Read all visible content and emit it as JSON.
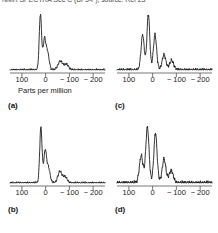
{
  "figure": {
    "clipped_header_text": "NMR SPECTRA See  C (BF3-F); source: Ref 23",
    "axis_caption": "Parts per million",
    "axis_caption_panel": "a"
  },
  "axis": {
    "tick_labels": [
      "100",
      "0",
      "− 100",
      "− 200"
    ],
    "tick_values": [
      100,
      0,
      -100,
      -200
    ],
    "xlim": [
      150,
      -250
    ],
    "xlabel": "Parts per million"
  },
  "panels": [
    {
      "key": "a",
      "label": "(a)"
    },
    {
      "key": "b",
      "label": "(b)"
    },
    {
      "key": "c",
      "label": "(c)"
    },
    {
      "key": "d",
      "label": "(d)"
    }
  ],
  "chart_data": [
    {
      "type": "line",
      "id": "a",
      "title": "(a)",
      "xlabel": "Parts per million",
      "ylabel": "",
      "xlim": [
        150,
        -250
      ],
      "ylim": [
        0,
        1
      ],
      "grid": false,
      "legend": "none",
      "axis_direction": "reversed",
      "tick_labels": [
        "100",
        "0",
        "− 100",
        "− 200"
      ],
      "tick_values": [
        100,
        0,
        -100,
        -200
      ],
      "peaks": [
        {
          "ppm": 22,
          "height": 1.0,
          "width": 5
        },
        {
          "ppm": 5,
          "height": 0.52,
          "width": 6
        },
        {
          "ppm": -8,
          "height": 0.3,
          "width": 7
        },
        {
          "ppm": -62,
          "height": 0.16,
          "width": 10
        },
        {
          "ppm": -88,
          "height": 0.1,
          "width": 9
        }
      ],
      "baseline_noise": 0.03
    },
    {
      "type": "line",
      "id": "b",
      "title": "(b)",
      "xlabel": "Parts per million",
      "ylabel": "",
      "xlim": [
        150,
        -250
      ],
      "ylim": [
        0,
        1
      ],
      "grid": false,
      "legend": "none",
      "axis_direction": "reversed",
      "tick_labels": [
        "100",
        "0",
        "− 100",
        "− 200"
      ],
      "tick_values": [
        100,
        0,
        -100,
        -200
      ],
      "peaks": [
        {
          "ppm": 20,
          "height": 1.0,
          "width": 5
        },
        {
          "ppm": 2,
          "height": 0.56,
          "width": 6
        },
        {
          "ppm": -12,
          "height": 0.26,
          "width": 7
        },
        {
          "ppm": -60,
          "height": 0.2,
          "width": 9
        },
        {
          "ppm": -82,
          "height": 0.11,
          "width": 9
        }
      ],
      "baseline_noise": 0.03
    },
    {
      "type": "line",
      "id": "c",
      "title": "(c)",
      "xlabel": "Parts per million",
      "ylabel": "",
      "xlim": [
        150,
        -250
      ],
      "ylim": [
        0,
        1
      ],
      "grid": false,
      "legend": "none",
      "axis_direction": "reversed",
      "tick_labels": [
        "100",
        "0",
        "− 100",
        "− 200"
      ],
      "tick_values": [
        100,
        0,
        -100,
        -200
      ],
      "peaks": [
        {
          "ppm": 42,
          "height": 0.62,
          "width": 7
        },
        {
          "ppm": 18,
          "height": 1.0,
          "width": 6
        },
        {
          "ppm": -10,
          "height": 0.62,
          "width": 7
        },
        {
          "ppm": -48,
          "height": 0.27,
          "width": 8
        },
        {
          "ppm": -80,
          "height": 0.17,
          "width": 9
        }
      ],
      "baseline_noise": 0.04
    },
    {
      "type": "line",
      "id": "d",
      "title": "(d)",
      "xlabel": "Parts per million",
      "ylabel": "",
      "xlim": [
        150,
        -250
      ],
      "ylim": [
        0,
        1
      ],
      "grid": false,
      "legend": "none",
      "axis_direction": "reversed",
      "tick_labels": [
        "100",
        "0",
        "− 100",
        "− 200"
      ],
      "tick_values": [
        100,
        0,
        -100,
        -200
      ],
      "peaks": [
        {
          "ppm": 48,
          "height": 0.48,
          "width": 8
        },
        {
          "ppm": 22,
          "height": 1.0,
          "width": 7
        },
        {
          "ppm": -12,
          "height": 0.88,
          "width": 7
        },
        {
          "ppm": -48,
          "height": 0.42,
          "width": 8
        },
        {
          "ppm": -78,
          "height": 0.22,
          "width": 9
        }
      ],
      "baseline_noise": 0.05
    }
  ],
  "colors": {
    "background": "#ffffff",
    "trace": "#111111",
    "axis": "#555555",
    "text": "#1a1a1a"
  }
}
